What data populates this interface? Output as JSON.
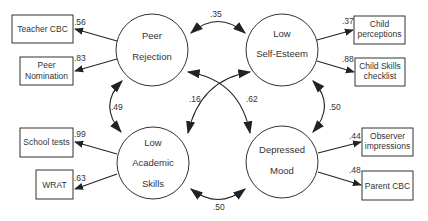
{
  "diagram": {
    "type": "structural-equation-model",
    "latent_variables": [
      {
        "id": "peer",
        "lines": [
          "Peer",
          "Rejection"
        ]
      },
      {
        "id": "self",
        "lines": [
          "Low",
          "Self-Esteem"
        ]
      },
      {
        "id": "acad",
        "lines": [
          "Low",
          "Academic",
          "Skills"
        ]
      },
      {
        "id": "mood",
        "lines": [
          "Depressed",
          "Mood"
        ]
      }
    ],
    "indicators": [
      {
        "id": "teacher_cbc",
        "lines": [
          "Teacher CBC"
        ],
        "latent": "peer",
        "loading": ".56"
      },
      {
        "id": "peer_nom",
        "lines": [
          "Peer",
          "Nomination"
        ],
        "latent": "peer",
        "loading": ".83"
      },
      {
        "id": "child_perc",
        "lines": [
          "Child",
          "perceptions"
        ],
        "latent": "self",
        "loading": ".37"
      },
      {
        "id": "child_skills",
        "lines": [
          "Child Skills",
          "checklist"
        ],
        "latent": "self",
        "loading": ".88"
      },
      {
        "id": "school_tests",
        "lines": [
          "School tests"
        ],
        "latent": "acad",
        "loading": ".99"
      },
      {
        "id": "wrat",
        "lines": [
          "WRAT"
        ],
        "latent": "acad",
        "loading": ".63"
      },
      {
        "id": "observer",
        "lines": [
          "Observer",
          "impressions"
        ],
        "latent": "mood",
        "loading": ".44"
      },
      {
        "id": "parent_cbc",
        "lines": [
          "Parent CBC"
        ],
        "latent": "mood",
        "loading": ".48"
      }
    ],
    "correlations": [
      {
        "from": "peer",
        "to": "self",
        "value": ".35"
      },
      {
        "from": "peer",
        "to": "acad",
        "value": ".49"
      },
      {
        "from": "self",
        "to": "mood",
        "value": ".50"
      },
      {
        "from": "acad",
        "to": "mood",
        "value": ".50"
      },
      {
        "from": "self",
        "to": "acad",
        "value": ".16"
      },
      {
        "from": "peer",
        "to": "mood",
        "value": ".62"
      }
    ]
  }
}
